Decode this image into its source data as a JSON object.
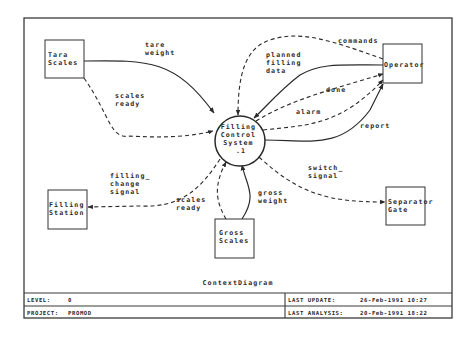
{
  "diagram": {
    "title": "ContextDiagram",
    "process": {
      "name": "Filling Control System",
      "lines": [
        "Filling",
        "Control",
        "System",
        ".1"
      ],
      "id": ".1"
    },
    "terminators": [
      {
        "id": "tara",
        "lines": [
          "Tara",
          "Scales"
        ]
      },
      {
        "id": "operator",
        "lines": [
          "Operator"
        ]
      },
      {
        "id": "filling-station",
        "lines": [
          "Filling",
          "Station"
        ]
      },
      {
        "id": "gross",
        "lines": [
          "Gross",
          "Scales"
        ]
      },
      {
        "id": "separator",
        "lines": [
          "Separator",
          "Gate"
        ]
      }
    ],
    "flows": [
      {
        "id": "tare-weight",
        "lines": [
          "tare",
          "weight"
        ],
        "style": "solid",
        "from": "Tara Scales",
        "to": "Filling Control System"
      },
      {
        "id": "scales-ready-tara",
        "lines": [
          "scales",
          "ready"
        ],
        "style": "dashed",
        "from": "Tara Scales",
        "to": "Filling Control System"
      },
      {
        "id": "commands",
        "lines": [
          "commands"
        ],
        "style": "dashed",
        "from": "Operator",
        "to": "Filling Control System"
      },
      {
        "id": "planned-filling-data",
        "lines": [
          "planned",
          "filling",
          "data"
        ],
        "style": "solid",
        "from": "Operator",
        "to": "Filling Control System"
      },
      {
        "id": "done",
        "lines": [
          "done"
        ],
        "style": "dashed",
        "from": "Filling Control System",
        "to": "Operator"
      },
      {
        "id": "alarm",
        "lines": [
          "alarm"
        ],
        "style": "dashed",
        "from": "Filling Control System",
        "to": "Operator"
      },
      {
        "id": "report",
        "lines": [
          "report"
        ],
        "style": "solid",
        "from": "Filling Control System",
        "to": "Operator"
      },
      {
        "id": "filling-change-signal",
        "lines": [
          "filling_",
          "change",
          "signal"
        ],
        "style": "dashed",
        "from": "Filling Control System",
        "to": "Filling Station"
      },
      {
        "id": "scales-ready-gross",
        "lines": [
          "scales",
          "ready"
        ],
        "style": "dashed",
        "from": "Gross Scales",
        "to": "Filling Control System"
      },
      {
        "id": "gross-weight",
        "lines": [
          "gross",
          "weight"
        ],
        "style": "solid",
        "from": "Gross Scales",
        "to": "Filling Control System"
      },
      {
        "id": "switch-signal",
        "lines": [
          "switch_",
          "signal"
        ],
        "style": "dashed",
        "from": "Filling Control System",
        "to": "Separator Gate"
      }
    ]
  },
  "footer": {
    "level_label": "LEVEL:",
    "level_value": "0",
    "project_label": "PROJECT:",
    "project_value": "PROMOD",
    "last_update_label": "LAST UPDATE:",
    "last_update_value": "26-Feb-1991 10:27",
    "last_analysis_label": "LAST ANALYSIS:",
    "last_analysis_value": "20-Feb-1991 18:22"
  },
  "colors": {
    "ink": "#2a2a2a",
    "paper": "#ffffff"
  }
}
